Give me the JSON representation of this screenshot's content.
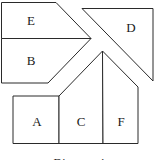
{
  "diagram": {
    "caption": "Diagram 4",
    "pieces": [
      {
        "id": "E",
        "label": "E"
      },
      {
        "id": "B",
        "label": "B"
      },
      {
        "id": "D",
        "label": "D"
      },
      {
        "id": "A",
        "label": "A"
      },
      {
        "id": "C",
        "label": "C"
      },
      {
        "id": "F",
        "label": "F"
      }
    ]
  }
}
